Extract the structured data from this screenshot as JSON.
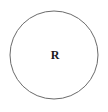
{
  "diagram": {
    "type": "venn-single-set",
    "background_color": "#ffffff",
    "canvas": {
      "width": 108,
      "height": 112
    },
    "shapes": [
      {
        "name": "circle",
        "shape": "circle",
        "center_x": 54,
        "center_y": 55,
        "radius": 44,
        "stroke_color": "#6b6b6b",
        "stroke_width": 1,
        "fill": "none"
      }
    ],
    "labels": [
      {
        "name": "region-label",
        "text": "R",
        "x": 55,
        "y": 56,
        "color": "#1a1a1a",
        "font_size": 12,
        "font_weight": "bold",
        "font_style": "serif"
      }
    ]
  }
}
